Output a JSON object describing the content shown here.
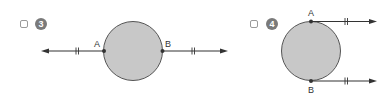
{
  "problems": [
    {
      "number": "3",
      "checked": false,
      "points": [
        {
          "label": "A"
        },
        {
          "label": "B"
        }
      ],
      "description": "Circle with line through A and B extending left and right with arrows, equal-length tick marks"
    },
    {
      "number": "4",
      "checked": false,
      "points": [
        {
          "label": "A"
        },
        {
          "label": "B"
        }
      ],
      "description": "Circle with tangent rays from A (top) and B (bottom) extending right, equal-length tick marks"
    }
  ],
  "colors": {
    "circle_fill": "#c8c8c8",
    "stroke": "#333333",
    "badge": "#7a7a7a",
    "checkbox_border": "#9a9a9a"
  }
}
